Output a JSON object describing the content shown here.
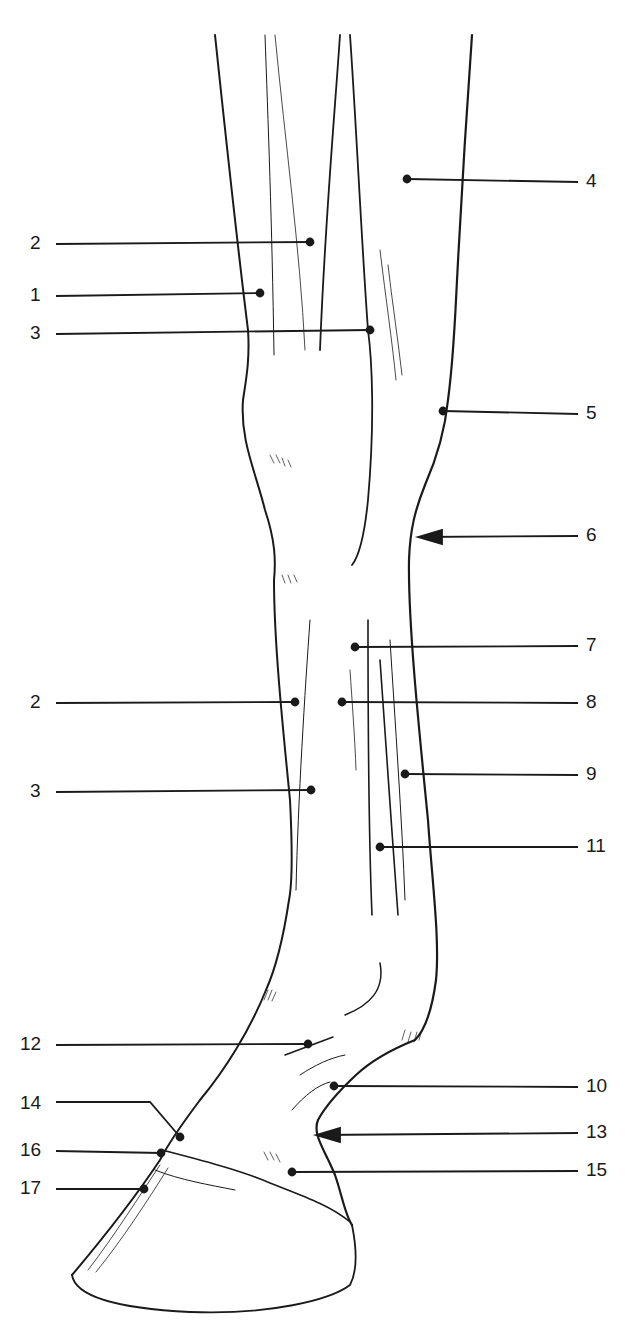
{
  "figure": {
    "ink_color": "#1a1a1a",
    "background": "#ffffff"
  },
  "labels": [
    {
      "id": "4",
      "text": "4",
      "side": "right",
      "label_x": 586,
      "label_y": 182,
      "point_x": 407,
      "point_y": 179,
      "type": "dot"
    },
    {
      "id": "2a",
      "text": "2",
      "side": "left",
      "label_x": 30,
      "label_y": 244,
      "point_x": 310,
      "point_y": 242,
      "type": "dot"
    },
    {
      "id": "1",
      "text": "1",
      "side": "left",
      "label_x": 30,
      "label_y": 296,
      "point_x": 260,
      "point_y": 293,
      "type": "dot"
    },
    {
      "id": "3a",
      "text": "3",
      "side": "left",
      "label_x": 30,
      "label_y": 334,
      "point_x": 370,
      "point_y": 330,
      "type": "dot"
    },
    {
      "id": "5",
      "text": "5",
      "side": "right",
      "label_x": 586,
      "label_y": 414,
      "point_x": 443,
      "point_y": 411,
      "type": "dot"
    },
    {
      "id": "6",
      "text": "6",
      "side": "right",
      "label_x": 586,
      "label_y": 536,
      "point_x": 418,
      "point_y": 537,
      "type": "arrow"
    },
    {
      "id": "7",
      "text": "7",
      "side": "right",
      "label_x": 586,
      "label_y": 646,
      "point_x": 355,
      "point_y": 647,
      "type": "dot"
    },
    {
      "id": "2b",
      "text": "2",
      "side": "left",
      "label_x": 30,
      "label_y": 703,
      "point_x": 295,
      "point_y": 702,
      "type": "dot"
    },
    {
      "id": "8",
      "text": "8",
      "side": "right",
      "label_x": 586,
      "label_y": 703,
      "point_x": 342,
      "point_y": 702,
      "type": "dot"
    },
    {
      "id": "9",
      "text": "9",
      "side": "right",
      "label_x": 586,
      "label_y": 775,
      "point_x": 405,
      "point_y": 774,
      "type": "dot"
    },
    {
      "id": "3b",
      "text": "3",
      "side": "left",
      "label_x": 30,
      "label_y": 792,
      "point_x": 311,
      "point_y": 790,
      "type": "dot"
    },
    {
      "id": "11",
      "text": "11",
      "side": "right",
      "label_x": 586,
      "label_y": 847,
      "point_x": 380,
      "point_y": 847,
      "type": "dot"
    },
    {
      "id": "12",
      "text": "12",
      "side": "left",
      "label_x": 20,
      "label_y": 1045,
      "point_x": 308,
      "point_y": 1044,
      "type": "dot"
    },
    {
      "id": "10",
      "text": "10",
      "side": "right",
      "label_x": 586,
      "label_y": 1087,
      "point_x": 334,
      "point_y": 1086,
      "type": "dot"
    },
    {
      "id": "14",
      "text": "14",
      "side": "left",
      "label_x": 20,
      "label_y": 1104,
      "point_x": 180,
      "point_y": 1137,
      "type": "dot-elbow",
      "elbow_x": 150,
      "elbow_y": 1102
    },
    {
      "id": "13",
      "text": "13",
      "side": "right",
      "label_x": 586,
      "label_y": 1133,
      "point_x": 316,
      "point_y": 1135,
      "type": "arrow"
    },
    {
      "id": "16",
      "text": "16",
      "side": "left",
      "label_x": 20,
      "label_y": 1151,
      "point_x": 161,
      "point_y": 1153,
      "type": "dot"
    },
    {
      "id": "15",
      "text": "15",
      "side": "right",
      "label_x": 586,
      "label_y": 1171,
      "point_x": 292,
      "point_y": 1172,
      "type": "dot"
    },
    {
      "id": "17",
      "text": "17",
      "side": "left",
      "label_x": 20,
      "label_y": 1189,
      "point_x": 144,
      "point_y": 1189,
      "type": "dot"
    }
  ]
}
